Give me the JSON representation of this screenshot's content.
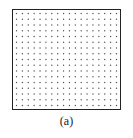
{
  "figure": {
    "caption": "(a)",
    "grid": {
      "columns": 18,
      "rows": 17,
      "dot_color": "#555555",
      "frame_color": "#222222"
    }
  }
}
